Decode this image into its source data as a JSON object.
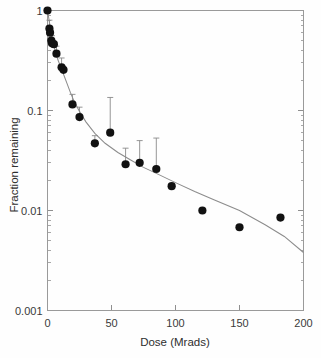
{
  "chart_data": {
    "type": "scatter",
    "title": "",
    "subtitle": "",
    "xlabel": "Dose (Mrads)",
    "ylabel": "Fraction remaining",
    "xlim": [
      0,
      200
    ],
    "ylim": [
      0.001,
      1
    ],
    "yscale": "log",
    "xscale": "linear",
    "grid": false,
    "legend": null,
    "xticks": [
      0,
      50,
      100,
      150,
      200
    ],
    "xticklabels": [
      "0",
      "50",
      "100",
      "150",
      "200"
    ],
    "yticks": [
      1,
      0.1,
      0.01,
      0.001
    ],
    "yticklabels": [
      "1",
      "0.1",
      "0.01",
      "0.001"
    ],
    "yminorticks": [
      0.9,
      0.8,
      0.7,
      0.6,
      0.5,
      0.4,
      0.3,
      0.2,
      0.09,
      0.08,
      0.07,
      0.06,
      0.05,
      0.04,
      0.03,
      0.02,
      0.009,
      0.008,
      0.007,
      0.006,
      0.005,
      0.004,
      0.003,
      0.002
    ],
    "series": [
      {
        "name": "measured",
        "marker": "filled-circle",
        "color": "#111111",
        "points": [
          {
            "x": 0.0,
            "y": 1.0
          },
          {
            "x": 1.5,
            "y": 0.66
          },
          {
            "x": 2.0,
            "y": 0.6
          },
          {
            "x": 3.0,
            "y": 0.5
          },
          {
            "x": 3.5,
            "y": 0.47
          },
          {
            "x": 5.0,
            "y": 0.46
          },
          {
            "x": 7.0,
            "y": 0.37
          },
          {
            "x": 11.0,
            "y": 0.27
          },
          {
            "x": 12.5,
            "y": 0.255
          },
          {
            "x": 19.5,
            "y": 0.115
          },
          {
            "x": 25.0,
            "y": 0.086
          },
          {
            "x": 37.0,
            "y": 0.047
          },
          {
            "x": 49.0,
            "y": 0.06
          },
          {
            "x": 61.0,
            "y": 0.029
          },
          {
            "x": 72.0,
            "y": 0.03
          },
          {
            "x": 85.0,
            "y": 0.026
          },
          {
            "x": 97.0,
            "y": 0.0175
          },
          {
            "x": 121.0,
            "y": 0.01
          },
          {
            "x": 150.0,
            "y": 0.0068
          },
          {
            "x": 182.0,
            "y": 0.0085
          }
        ]
      }
    ],
    "errorbars": [
      {
        "x": 1.5,
        "y": 0.66,
        "upper": 0.8
      },
      {
        "x": 3.5,
        "y": 0.47,
        "upper": 0.56
      },
      {
        "x": 7.0,
        "y": 0.37,
        "upper": 0.44
      },
      {
        "x": 11.0,
        "y": 0.27,
        "upper": 0.335
      },
      {
        "x": 19.5,
        "y": 0.115,
        "upper": 0.145
      },
      {
        "x": 25.0,
        "y": 0.086,
        "upper": 0.108
      },
      {
        "x": 37.0,
        "y": 0.047,
        "upper": 0.056
      },
      {
        "x": 49.0,
        "y": 0.06,
        "upper": 0.135
      },
      {
        "x": 61.0,
        "y": 0.029,
        "upper": 0.042
      },
      {
        "x": 72.0,
        "y": 0.03,
        "upper": 0.05
      },
      {
        "x": 85.0,
        "y": 0.026,
        "upper": 0.053
      }
    ],
    "fit_curve": {
      "name": "biexponential-fit",
      "color": "#8c8c8c",
      "points": [
        {
          "x": 0.0,
          "y": 1.0
        },
        {
          "x": 2.0,
          "y": 0.7
        },
        {
          "x": 4.0,
          "y": 0.5
        },
        {
          "x": 6.0,
          "y": 0.395
        },
        {
          "x": 8.0,
          "y": 0.325
        },
        {
          "x": 10.0,
          "y": 0.278
        },
        {
          "x": 12.0,
          "y": 0.24
        },
        {
          "x": 15.0,
          "y": 0.19
        },
        {
          "x": 18.0,
          "y": 0.15
        },
        {
          "x": 21.0,
          "y": 0.122
        },
        {
          "x": 25.0,
          "y": 0.098
        },
        {
          "x": 30.0,
          "y": 0.077
        },
        {
          "x": 37.0,
          "y": 0.059
        },
        {
          "x": 45.0,
          "y": 0.047
        },
        {
          "x": 55.0,
          "y": 0.038
        },
        {
          "x": 65.0,
          "y": 0.032
        },
        {
          "x": 75.0,
          "y": 0.027
        },
        {
          "x": 85.0,
          "y": 0.0235
        },
        {
          "x": 100.0,
          "y": 0.019
        },
        {
          "x": 115.0,
          "y": 0.0155
        },
        {
          "x": 130.0,
          "y": 0.0128
        },
        {
          "x": 150.0,
          "y": 0.01
        },
        {
          "x": 170.0,
          "y": 0.0072
        },
        {
          "x": 185.0,
          "y": 0.0055
        },
        {
          "x": 200.0,
          "y": 0.0038
        }
      ]
    }
  },
  "axes": {
    "x_title": "Dose (Mrads)",
    "y_title": "Fraction remaining",
    "x_tick_labels": [
      "0",
      "50",
      "100",
      "150",
      "200"
    ],
    "y_tick_labels": [
      "1",
      "0.1",
      "0.01",
      "0.001"
    ]
  }
}
